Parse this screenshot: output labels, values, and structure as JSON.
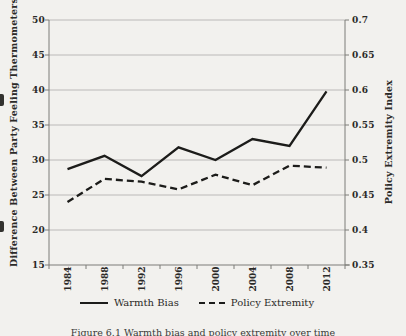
{
  "figure": {
    "caption": "Figure 6.1  Warmth bias and policy extremity over time"
  },
  "chart_data": {
    "type": "line",
    "categories": [
      "1984",
      "1988",
      "1992",
      "1996",
      "2000",
      "2004",
      "2008",
      "2012"
    ],
    "series": [
      {
        "name": "Warmth Bias",
        "axis": "left",
        "style": "solid",
        "values": [
          28.7,
          30.6,
          27.7,
          31.8,
          30.0,
          33.0,
          32.0,
          39.8
        ]
      },
      {
        "name": "Policy Extremity",
        "axis": "right",
        "style": "dashed",
        "values": [
          0.44,
          0.473,
          0.469,
          0.458,
          0.479,
          0.464,
          0.492,
          0.489
        ]
      }
    ],
    "left_axis": {
      "label": "Difference Between Party Feeling Thermometers",
      "ticks": [
        50,
        45,
        40,
        35,
        30,
        25,
        20,
        15
      ],
      "min": 15,
      "max": 50
    },
    "right_axis": {
      "label": "Policy Extremity Index",
      "ticks": [
        "0.7",
        "0.65",
        "0.6",
        "0.55",
        "0.5",
        "0.45",
        "0.4",
        "0.35"
      ],
      "min": 0.35,
      "max": 0.7
    },
    "legend": [
      {
        "label": "Warmth Bias",
        "style": "solid"
      },
      {
        "label": "Policy Extremity",
        "style": "dashed"
      }
    ],
    "grid": true,
    "legend_position": "bottom",
    "colors": {
      "line": "#1c1c1a",
      "grid": "#b4b3b1",
      "axis": "#7d7c79",
      "text": "#2b2a28",
      "background": "#f2f1ee"
    }
  }
}
